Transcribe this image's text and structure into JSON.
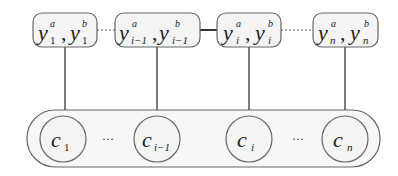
{
  "diagram": {
    "type": "factor-graph",
    "top_nodes": [
      {
        "id": "y1",
        "var": "y",
        "sub": "1",
        "sup_a": "a",
        "sup_b": "b",
        "label": "y_1^a, y_1^b"
      },
      {
        "id": "yim1",
        "var": "y",
        "sub": "i−1",
        "sup_a": "a",
        "sup_b": "b",
        "label": "y_{i-1}^a, y_{i-1}^b"
      },
      {
        "id": "yi",
        "var": "y",
        "sub": "i",
        "sup_a": "a",
        "sup_b": "b",
        "label": "y_i^a, y_i^b"
      },
      {
        "id": "yn",
        "var": "y",
        "sub": "n",
        "sup_a": "a",
        "sup_b": "b",
        "label": "y_n^a, y_n^b"
      }
    ],
    "bottom_nodes": [
      {
        "id": "c1",
        "var": "c",
        "sub": "1",
        "label": "c_1"
      },
      {
        "id": "cim1",
        "var": "c",
        "sub": "i−1",
        "label": "c_{i-1}"
      },
      {
        "id": "ci",
        "var": "c",
        "sub": "i",
        "label": "c_i"
      },
      {
        "id": "cn",
        "var": "c",
        "sub": "n",
        "label": "c_n"
      }
    ],
    "ellipsis": "···",
    "edges": [
      {
        "from": "y1",
        "to": "yim1",
        "style": "dotted"
      },
      {
        "from": "yim1",
        "to": "yi",
        "style": "solid"
      },
      {
        "from": "yi",
        "to": "yn",
        "style": "dotted"
      },
      {
        "from": "y1",
        "to": "c1",
        "style": "solid"
      },
      {
        "from": "yim1",
        "to": "cim1",
        "style": "solid"
      },
      {
        "from": "yi",
        "to": "ci",
        "style": "solid"
      },
      {
        "from": "yn",
        "to": "cn",
        "style": "solid"
      }
    ],
    "colors": {
      "stroke": "#555555",
      "fill": "#f4f4f4",
      "text": "#222222"
    }
  }
}
